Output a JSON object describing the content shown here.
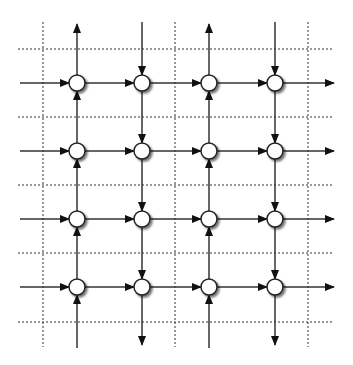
{
  "diagram": {
    "type": "directed-grid-network",
    "colors": {
      "background": "#ffffff",
      "edge": "#333333",
      "arrowhead": "#111111",
      "node_fill": "#ffffff",
      "node_stroke": "#222222",
      "node_shadow": "#9a9a9a",
      "grid_dotted": "#333333"
    },
    "node_radius": 8,
    "columns_x": [
      77,
      142,
      209,
      275
    ],
    "rows_y": [
      83,
      151,
      219,
      287
    ],
    "column_directions": [
      "up",
      "down",
      "up",
      "down"
    ],
    "row_direction": "right",
    "dotted_grid": {
      "vertical_x": [
        43,
        175,
        308
      ],
      "vertical_y_range": [
        22,
        347
      ],
      "horizontal_y": [
        49,
        117,
        185,
        253,
        322
      ],
      "horizontal_x_range": [
        18,
        334
      ]
    },
    "outer_edges": {
      "left_start_x": 20,
      "right_end_x": 334,
      "top_y": 22,
      "bottom_y": 348
    }
  }
}
